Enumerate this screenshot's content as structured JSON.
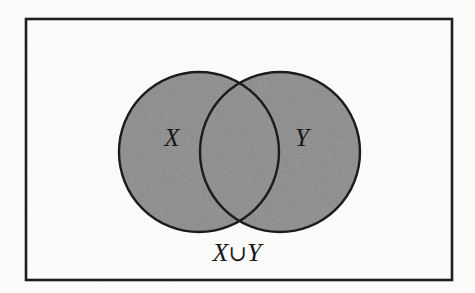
{
  "figure": {
    "kind": "venn-diagram",
    "caption": "X∪Y",
    "caption_parts": {
      "left_set": "X",
      "operator": "∪",
      "right_set": "Y"
    },
    "labels": {
      "left_circle": "X",
      "right_circle": "Y"
    },
    "colors": {
      "shading": "#8a8a8a",
      "outline": "#1c1c1c",
      "border": "#1f1f1f",
      "paper": "#fdfdfc",
      "text": "#171717"
    },
    "geometry": {
      "rectangle": {
        "x": 26,
        "y": 19,
        "width": 426,
        "height": 261
      },
      "left_circle": {
        "cx": 199,
        "cy": 152,
        "r": 80
      },
      "right_circle": {
        "cx": 280,
        "cy": 152,
        "r": 80
      },
      "label_x": {
        "x": 172,
        "y": 146
      },
      "label_y": {
        "x": 302,
        "y": 146
      },
      "caption": {
        "x": 237,
        "y": 261
      }
    }
  }
}
